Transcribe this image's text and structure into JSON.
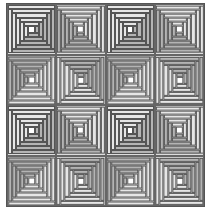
{
  "quilt": {
    "rows": 4,
    "cols": 4,
    "rings": 5,
    "colors": {
      "light": "#e6e6e6",
      "dark": "#b4b4b4",
      "center": "#ffffff",
      "line": "#555555"
    },
    "rotations": [
      [
        0,
        90,
        0,
        90
      ],
      [
        180,
        270,
        180,
        270
      ],
      [
        0,
        90,
        0,
        90
      ],
      [
        180,
        270,
        180,
        270
      ]
    ]
  }
}
